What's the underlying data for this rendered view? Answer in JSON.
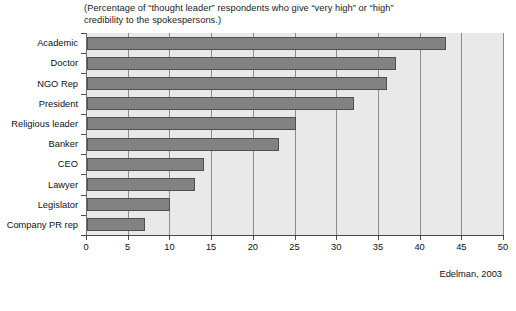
{
  "subtitle": "(Percentage of “thought leader” respondents who give “very high” or “high”\ncredibility to the spokespersons.)",
  "source": "Edelman, 2003",
  "footnote": "",
  "colors": {
    "bar_fill": "#828282",
    "bar_edge": "#4f4f4f",
    "plot_background": "#e9e9e9",
    "gridline": "#8c8c8c",
    "axis": "#4a4a4a",
    "text": "#111111"
  },
  "chart_data": {
    "type": "bar",
    "orientation": "horizontal",
    "title": "",
    "subtitle": "(Percentage of “thought leader” respondents who give “very high” or “high” credibility to the spokespersons.)",
    "xlabel": "",
    "ylabel": "",
    "xlim": [
      0,
      50
    ],
    "ylim": null,
    "xticks": [
      0,
      5,
      10,
      15,
      20,
      25,
      30,
      35,
      40,
      45,
      50
    ],
    "xticklabels": [
      "0",
      "5",
      "10",
      "15",
      "20",
      "25",
      "30",
      "35",
      "40",
      "45",
      "50"
    ],
    "grid": "vertical",
    "legend": null,
    "annotations": [
      "Edelman, 2003"
    ],
    "categories": [
      "Academic",
      "Doctor",
      "NGO Rep",
      "President",
      "Religious leader",
      "Banker",
      "CEO",
      "Lawyer",
      "Legislator",
      "Company PR rep"
    ],
    "values": [
      43,
      37,
      36,
      32,
      25,
      23,
      14,
      13,
      10,
      7
    ]
  }
}
